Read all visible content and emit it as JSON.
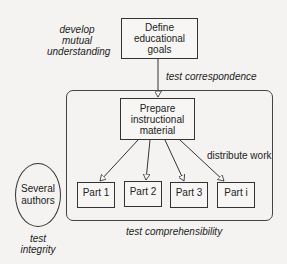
{
  "diagram": {
    "nodes": {
      "define_goals": "Define educational goals",
      "define_goals_lines": [
        "Define",
        "educational",
        "goals"
      ],
      "prepare_material_lines": [
        "Prepare",
        "instructional",
        "material"
      ],
      "parts": [
        "Part 1",
        "Part 2",
        "Part 3",
        "Part i"
      ],
      "authors_lines": [
        "Several",
        "authors"
      ]
    },
    "annotations": {
      "develop_lines": [
        "develop",
        "mutual",
        "understanding"
      ],
      "test_correspondence": "test correspondence",
      "distribute_work": "distribute work",
      "test_comprehensibility": "test comprehensibility",
      "test_integrity_lines": [
        "test",
        "integrity"
      ]
    },
    "edges": [
      {
        "from": "Define educational goals",
        "to": "Prepare instructional material",
        "label": "test correspondence"
      },
      {
        "from": "Prepare instructional material",
        "to": "Part 1"
      },
      {
        "from": "Prepare instructional material",
        "to": "Part 2"
      },
      {
        "from": "Prepare instructional material",
        "to": "Part 3"
      },
      {
        "from": "Prepare instructional material",
        "to": "Part i"
      }
    ],
    "colors": {
      "line": "#333333",
      "background": "#f4f3f1"
    }
  }
}
